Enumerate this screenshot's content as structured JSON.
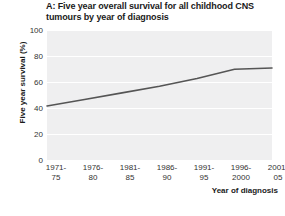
{
  "chart_data": {
    "type": "line",
    "title": "A: Five year overall survival for all childhood CNS tumours by year of diagnosis",
    "xlabel": "Year of diagnosis",
    "ylabel": "Five year survival (%)",
    "categories": [
      "1971-75",
      "1976-80",
      "1981-85",
      "1986-90",
      "1991-95",
      "1996-2000",
      "2001-05"
    ],
    "values": [
      42,
      47,
      52,
      57,
      63,
      70,
      71
    ],
    "ylim": [
      0,
      100
    ],
    "yticks": [
      0,
      20,
      40,
      60,
      80,
      100
    ],
    "grid": true,
    "legend": false,
    "series": [
      {
        "name": "All childhood CNS tumours",
        "values": [
          42,
          47,
          52,
          57,
          63,
          70,
          71
        ],
        "color": "#555555"
      }
    ]
  },
  "title": {
    "text": "A: Five year overall survival for all childhood CNS tumours by year of diagnosis"
  },
  "axes": {
    "y_title": "Five year survival (%)",
    "x_title": "Year of diagnosis",
    "y_ticks": [
      "100",
      "80",
      "60",
      "40",
      "20",
      "0"
    ],
    "x_ticks": [
      {
        "line1": "1971-",
        "line2": "75"
      },
      {
        "line1": "1976-",
        "line2": "80"
      },
      {
        "line1": "1981-",
        "line2": "85"
      },
      {
        "line1": "1986-",
        "line2": "90"
      },
      {
        "line1": "1991-",
        "line2": "95"
      },
      {
        "line1": "1996-",
        "line2": "2000"
      },
      {
        "line1": "2001-",
        "line2": "05"
      }
    ]
  },
  "colors": {
    "plot_background": "#efeff0",
    "gridline": "#ffffff",
    "data_line": "#555555",
    "text": "#333333"
  }
}
